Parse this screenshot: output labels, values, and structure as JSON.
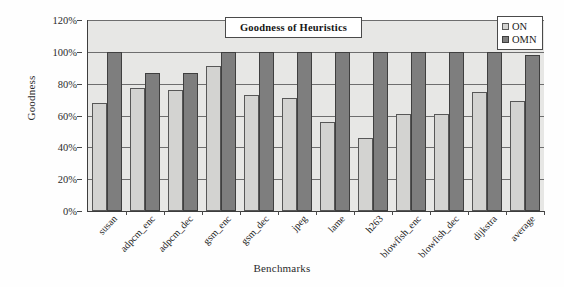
{
  "chart_data": {
    "type": "bar",
    "title": "Goodness of Heuristics",
    "xlabel": "Benchmarks",
    "ylabel": "Goodness",
    "ylim": [
      0,
      120
    ],
    "ytick_labels": [
      "0%",
      "20%",
      "40%",
      "60%",
      "80%",
      "100%",
      "120%"
    ],
    "ytick_values": [
      0,
      20,
      40,
      60,
      80,
      100,
      120
    ],
    "grid": true,
    "legend_position": "top-right",
    "categories": [
      "susan",
      "adpcm_enc",
      "adpcm_dec",
      "gsm_enc",
      "gsm_dec",
      "jpeg",
      "lame",
      "h263",
      "blowfish_enc",
      "blowfish_dec",
      "dijkstra",
      "average"
    ],
    "series": [
      {
        "name": "ON",
        "color": "#d3d3d1",
        "values": [
          68,
          77,
          76,
          91,
          73,
          71,
          56,
          46,
          61,
          61,
          75,
          69
        ]
      },
      {
        "name": "OMN",
        "color": "#7e7e7e",
        "values": [
          100,
          87,
          87,
          100,
          100,
          100,
          100,
          100,
          100,
          100,
          100,
          98
        ]
      }
    ]
  }
}
